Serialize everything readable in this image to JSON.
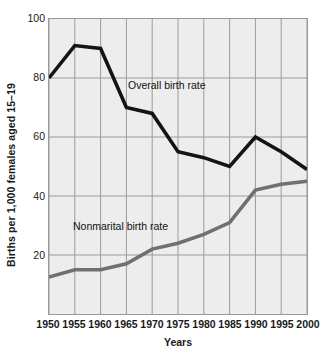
{
  "chart_data": {
    "type": "line",
    "title": "",
    "xlabel": "Years",
    "ylabel": "Births per 1,000 females aged 15–19",
    "x": [
      1950,
      1955,
      1960,
      1965,
      1970,
      1975,
      1980,
      1985,
      1990,
      1995,
      2000
    ],
    "xtick_labels": [
      "1950",
      "1955",
      "1960",
      "1965",
      "1970",
      "1975",
      "1980",
      "1985",
      "1990",
      "1995",
      "2000"
    ],
    "ytick_labels": [
      "20",
      "40",
      "60",
      "80",
      "100"
    ],
    "yticks": [
      20,
      40,
      60,
      80,
      100
    ],
    "xlim": [
      1950,
      2000
    ],
    "ylim": [
      0,
      100
    ],
    "grid": true,
    "legend_position": "inline-annotations",
    "plot_background": "#ededed",
    "grid_color": "#9a9a9a",
    "series": [
      {
        "name": "Overall birth rate",
        "color": "#141414",
        "line_width": 3.6,
        "values": [
          80,
          91,
          90,
          70,
          68,
          55,
          53,
          50,
          60,
          55,
          49
        ],
        "annotation": {
          "text": "Overall birth rate",
          "x_px": 127,
          "y_px": 78
        }
      },
      {
        "name": "Nonmarital birth rate",
        "color": "#707070",
        "line_width": 3.6,
        "values": [
          12.5,
          15,
          15,
          17,
          22,
          24,
          27,
          31,
          42,
          44,
          45
        ],
        "annotation": {
          "text": "Nonmarital birth rate",
          "x_px": 72,
          "y_px": 219
        }
      }
    ]
  }
}
